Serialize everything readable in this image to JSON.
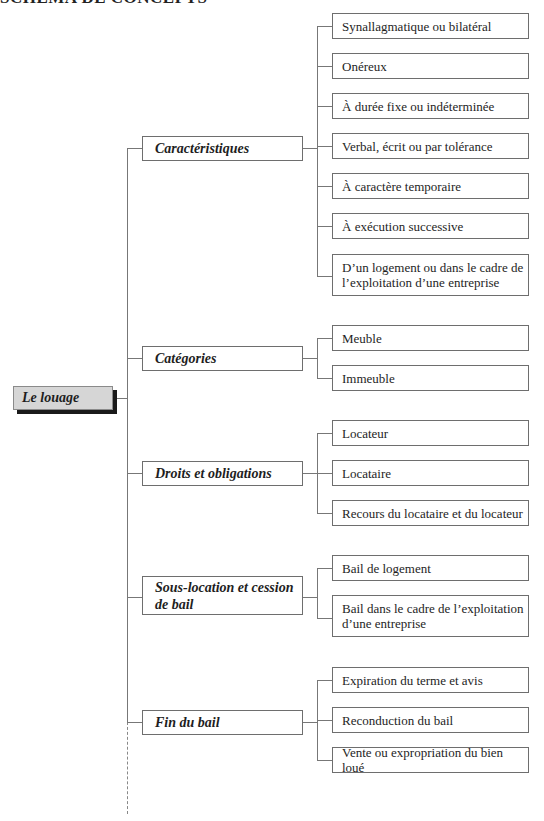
{
  "header": {
    "title": "SCHÉMA DE CONCEPTS"
  },
  "root": {
    "label": "Le louage"
  },
  "categories": [
    {
      "label": "Caractéristiques",
      "children": [
        "Synallagmatique ou bilatéral",
        "Onéreux",
        "À durée fixe ou indéterminée",
        "Verbal, écrit ou par tolérance",
        "À caractère temporaire",
        "À exécution successive",
        "D’un logement ou dans le cadre de l’exploitation d’une entreprise"
      ]
    },
    {
      "label": "Catégories",
      "children": [
        "Meuble",
        "Immeuble"
      ]
    },
    {
      "label": "Droits et obligations",
      "children": [
        "Locateur",
        "Locataire",
        "Recours du locataire et du locateur"
      ]
    },
    {
      "label": "Sous-location et cession de bail",
      "children": [
        "Bail de logement",
        "Bail dans le cadre de l’exploitation d’une entreprise"
      ]
    },
    {
      "label": "Fin du bail",
      "children": [
        "Expiration du terme et avis",
        "Reconduction du bail",
        "Vente ou expropriation du bien loué"
      ]
    }
  ],
  "colors": {
    "root_fill": "#d6d6d6",
    "root_shadow": "#1a1a1a",
    "line": "#777777",
    "border": "#6e6e6e"
  }
}
